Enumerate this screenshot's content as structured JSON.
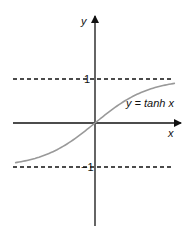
{
  "chart_data": {
    "type": "line",
    "title": "",
    "xlabel": "x",
    "ylabel": "y",
    "curve_label": "y = tanh x",
    "function": "tanh",
    "x": [
      -1.5,
      -1.0,
      -0.5,
      0,
      0.5,
      1.0,
      1.5
    ],
    "values": [
      -0.905,
      -0.762,
      -0.462,
      0,
      0.462,
      0.762,
      0.905
    ],
    "asymptotes": [
      1,
      -1
    ],
    "ytick_labels": [
      "1",
      "-1"
    ],
    "ylim": [
      -2.4,
      2.4
    ],
    "grid": false
  },
  "labels": {
    "y_axis": "y",
    "x_axis": "x",
    "curve": "y = tanh x",
    "tick_pos": "1",
    "tick_neg": "−1"
  },
  "colors": {
    "axis": "#111111",
    "curve": "#999999",
    "asymptote": "#111111"
  }
}
